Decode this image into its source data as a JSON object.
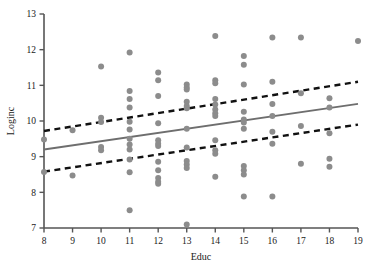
{
  "chart_data": {
    "type": "scatter",
    "title": "",
    "xlabel": "Educ",
    "ylabel": "Loginc",
    "xlim": [
      8,
      19
    ],
    "ylim": [
      7,
      13
    ],
    "xticks": [
      8,
      9,
      10,
      11,
      12,
      13,
      14,
      15,
      16,
      17,
      18,
      19
    ],
    "yticks": [
      7,
      8,
      9,
      10,
      11,
      12,
      13
    ],
    "grid": false,
    "legend": "none",
    "marker": {
      "shape": "circle",
      "color": "#8c8c8c",
      "size": 3.0
    },
    "points": [
      {
        "x": 8,
        "y": 9.48
      },
      {
        "x": 8,
        "y": 8.57
      },
      {
        "x": 9,
        "y": 9.74
      },
      {
        "x": 9,
        "y": 8.47
      },
      {
        "x": 10,
        "y": 11.53
      },
      {
        "x": 10,
        "y": 10.09
      },
      {
        "x": 10,
        "y": 9.97
      },
      {
        "x": 10,
        "y": 9.27
      },
      {
        "x": 10,
        "y": 9.18
      },
      {
        "x": 11,
        "y": 11.92
      },
      {
        "x": 11,
        "y": 10.84
      },
      {
        "x": 11,
        "y": 10.62
      },
      {
        "x": 11,
        "y": 10.38
      },
      {
        "x": 11,
        "y": 9.98
      },
      {
        "x": 11,
        "y": 9.76
      },
      {
        "x": 11,
        "y": 9.5
      },
      {
        "x": 11,
        "y": 9.34
      },
      {
        "x": 11,
        "y": 9.2
      },
      {
        "x": 11,
        "y": 8.92
      },
      {
        "x": 11,
        "y": 8.56
      },
      {
        "x": 11,
        "y": 7.5
      },
      {
        "x": 12,
        "y": 11.36
      },
      {
        "x": 12,
        "y": 11.14
      },
      {
        "x": 12,
        "y": 10.7
      },
      {
        "x": 12,
        "y": 9.94
      },
      {
        "x": 12,
        "y": 9.46
      },
      {
        "x": 12,
        "y": 9.36
      },
      {
        "x": 12,
        "y": 9.3
      },
      {
        "x": 12,
        "y": 8.86
      },
      {
        "x": 12,
        "y": 8.62
      },
      {
        "x": 12,
        "y": 8.4
      },
      {
        "x": 12,
        "y": 8.3
      },
      {
        "x": 12,
        "y": 8.24
      },
      {
        "x": 13,
        "y": 11.02
      },
      {
        "x": 13,
        "y": 10.94
      },
      {
        "x": 13,
        "y": 10.88
      },
      {
        "x": 13,
        "y": 10.54
      },
      {
        "x": 13,
        "y": 10.42
      },
      {
        "x": 13,
        "y": 10.36
      },
      {
        "x": 13,
        "y": 9.78
      },
      {
        "x": 13,
        "y": 9.26
      },
      {
        "x": 13,
        "y": 8.88
      },
      {
        "x": 13,
        "y": 8.78
      },
      {
        "x": 13,
        "y": 8.68
      },
      {
        "x": 13,
        "y": 7.1
      },
      {
        "x": 14,
        "y": 12.38
      },
      {
        "x": 14,
        "y": 11.14
      },
      {
        "x": 14,
        "y": 11.06
      },
      {
        "x": 14,
        "y": 10.62
      },
      {
        "x": 14,
        "y": 10.46
      },
      {
        "x": 14,
        "y": 10.32
      },
      {
        "x": 14,
        "y": 10.22
      },
      {
        "x": 14,
        "y": 10.14
      },
      {
        "x": 14,
        "y": 9.46
      },
      {
        "x": 14,
        "y": 9.18
      },
      {
        "x": 14,
        "y": 9.08
      },
      {
        "x": 14,
        "y": 8.44
      },
      {
        "x": 15,
        "y": 11.82
      },
      {
        "x": 15,
        "y": 11.58
      },
      {
        "x": 15,
        "y": 11.02
      },
      {
        "x": 15,
        "y": 10.26
      },
      {
        "x": 15,
        "y": 10.04
      },
      {
        "x": 15,
        "y": 9.96
      },
      {
        "x": 15,
        "y": 9.78
      },
      {
        "x": 15,
        "y": 8.74
      },
      {
        "x": 15,
        "y": 8.62
      },
      {
        "x": 15,
        "y": 8.5
      },
      {
        "x": 15,
        "y": 7.88
      },
      {
        "x": 16,
        "y": 12.34
      },
      {
        "x": 16,
        "y": 11.1
      },
      {
        "x": 16,
        "y": 10.48
      },
      {
        "x": 16,
        "y": 10.14
      },
      {
        "x": 16,
        "y": 9.7
      },
      {
        "x": 16,
        "y": 9.36
      },
      {
        "x": 16,
        "y": 7.88
      },
      {
        "x": 17,
        "y": 12.34
      },
      {
        "x": 17,
        "y": 10.78
      },
      {
        "x": 17,
        "y": 9.86
      },
      {
        "x": 17,
        "y": 8.8
      },
      {
        "x": 18,
        "y": 10.64
      },
      {
        "x": 18,
        "y": 10.38
      },
      {
        "x": 18,
        "y": 9.66
      },
      {
        "x": 18,
        "y": 8.94
      },
      {
        "x": 18,
        "y": 8.72
      },
      {
        "x": 19,
        "y": 12.24
      }
    ],
    "fit_line": {
      "name": "regression-line",
      "style": "solid",
      "color": "#6e6e6e",
      "x": [
        8,
        19
      ],
      "y": [
        9.2,
        10.48
      ]
    },
    "confidence_bands": [
      {
        "name": "upper-confidence-band",
        "style": "dashed",
        "color": "#111111",
        "x": [
          8,
          19
        ],
        "y": [
          9.72,
          11.1
        ]
      },
      {
        "name": "lower-confidence-band",
        "style": "dashed",
        "color": "#111111",
        "x": [
          8,
          19
        ],
        "y": [
          8.58,
          9.9
        ]
      }
    ]
  },
  "axis": {
    "x_title": "Educ",
    "y_title": "Loginc",
    "x_tick_labels": [
      "8",
      "9",
      "10",
      "11",
      "12",
      "13",
      "14",
      "15",
      "16",
      "17",
      "18",
      "19"
    ],
    "y_tick_labels": [
      "7",
      "8",
      "9",
      "10",
      "11",
      "12",
      "13"
    ]
  },
  "colors": {
    "marker": "#8c8c8c",
    "fit": "#6e6e6e",
    "band": "#111111",
    "axis": "#555555",
    "text": "#1a1a1a",
    "background": "#ffffff"
  }
}
